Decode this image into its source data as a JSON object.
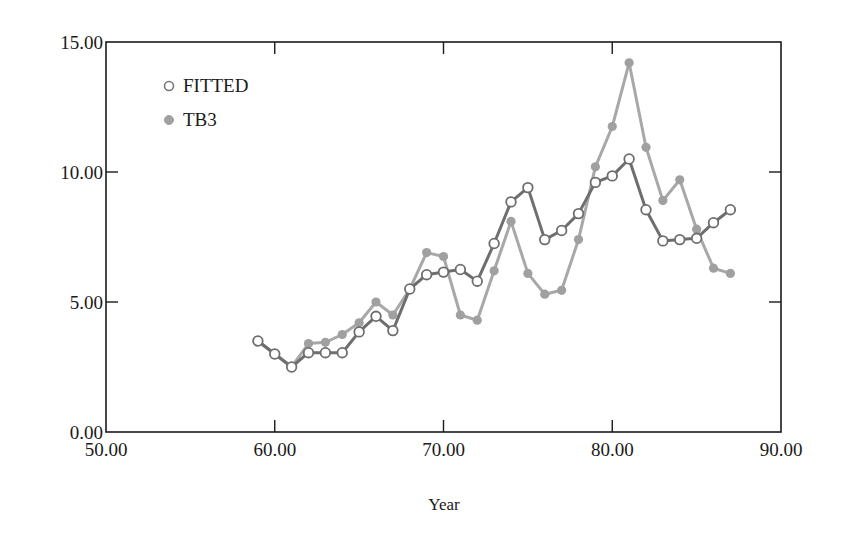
{
  "chart_data": {
    "type": "line",
    "title": "",
    "xlabel": "Year",
    "ylabel": "",
    "xlim": [
      50,
      90
    ],
    "ylim": [
      0,
      15
    ],
    "x_ticks": [
      "50.00",
      "60.00",
      "70.00",
      "80.00",
      "90.00"
    ],
    "y_ticks": [
      "0.00",
      "5.00",
      "10.00",
      "15.00"
    ],
    "grid": false,
    "legend_position": "upper-left",
    "x": [
      59,
      60,
      61,
      62,
      63,
      64,
      65,
      66,
      67,
      68,
      69,
      70,
      71,
      72,
      73,
      74,
      75,
      76,
      77,
      78,
      79,
      80,
      81,
      82,
      83,
      84,
      85,
      86,
      87
    ],
    "series": [
      {
        "name": "FITTED",
        "marker": "open-circle",
        "line_color": "#6e6e6e",
        "marker_fill": "#ffffff",
        "values": [
          3.5,
          3.0,
          2.5,
          3.05,
          3.05,
          3.05,
          3.85,
          4.45,
          3.9,
          5.5,
          6.05,
          6.15,
          6.25,
          5.8,
          7.25,
          8.85,
          9.4,
          7.4,
          7.75,
          8.4,
          9.6,
          9.85,
          10.5,
          8.55,
          7.35,
          7.4,
          7.45,
          8.05,
          8.55
        ]
      },
      {
        "name": "TB3",
        "marker": "filled-circle",
        "line_color": "#a8a8a8",
        "marker_fill": "#a0a0a0",
        "values": [
          3.5,
          3.0,
          2.5,
          3.4,
          3.45,
          3.75,
          4.2,
          5.0,
          4.5,
          5.5,
          6.9,
          6.75,
          4.5,
          4.3,
          6.2,
          8.1,
          6.1,
          5.3,
          5.45,
          7.4,
          10.2,
          11.75,
          14.2,
          10.95,
          8.9,
          9.7,
          7.8,
          6.3,
          6.1
        ]
      }
    ]
  },
  "legend": {
    "items": [
      {
        "label": "FITTED"
      },
      {
        "label": "TB3"
      }
    ]
  },
  "axes": {
    "x_title": "Year"
  }
}
